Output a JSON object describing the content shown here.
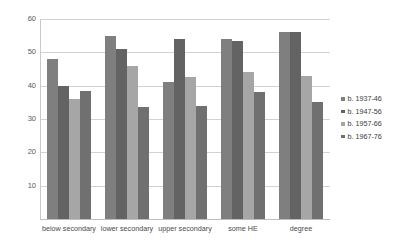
{
  "chart_data": {
    "type": "bar",
    "title": "",
    "subtitle": "",
    "xlabel": "",
    "ylabel": "",
    "ylim": [
      0,
      60
    ],
    "yticks": [
      0,
      10,
      20,
      30,
      40,
      50,
      60
    ],
    "ytick_labels": [
      "",
      "10",
      "20",
      "30",
      "40",
      "50",
      "60"
    ],
    "grid": true,
    "legend_position": "right",
    "categories": [
      "below secondary",
      "lower secondary",
      "upper secondary",
      "some HE",
      "degree"
    ],
    "series": [
      {
        "name": "b. 1937-46",
        "color": "#7f7f7f",
        "values": [
          48,
          55,
          41,
          54,
          56
        ]
      },
      {
        "name": "b. 1947-56",
        "color": "#636363",
        "values": [
          40,
          51,
          54,
          53.5,
          56
        ]
      },
      {
        "name": "b. 1957-66",
        "color": "#a6a6a6",
        "values": [
          36,
          46,
          42.5,
          44,
          43
        ]
      },
      {
        "name": "b. 1967-76",
        "color": "#707070",
        "values": [
          38.5,
          33.5,
          34,
          38,
          35
        ]
      }
    ]
  },
  "colors": {
    "background": "#ffffff",
    "gridline": "#d2d2d2",
    "axis": "#c9c9c9",
    "text": "#3b3b3b"
  }
}
